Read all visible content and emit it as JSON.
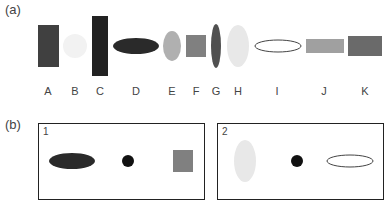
{
  "panels": {
    "a": {
      "label": "(a)",
      "shapes": [
        {
          "id": "A",
          "label": "A",
          "type": "rect",
          "color": "#404040"
        },
        {
          "id": "B",
          "label": "B",
          "type": "circle",
          "color": "#f2f2f2"
        },
        {
          "id": "C",
          "label": "C",
          "type": "rect",
          "color": "#222222"
        },
        {
          "id": "D",
          "label": "D",
          "type": "ellipse-horizontal",
          "color": "#2a2a2a"
        },
        {
          "id": "E",
          "label": "E",
          "type": "ellipse-vertical",
          "color": "#b0b0b0"
        },
        {
          "id": "F",
          "label": "F",
          "type": "square",
          "color": "#808080"
        },
        {
          "id": "G",
          "label": "G",
          "type": "ellipse-vertical",
          "color": "#505050"
        },
        {
          "id": "H",
          "label": "H",
          "type": "ellipse-vertical",
          "color": "#e8e8e8"
        },
        {
          "id": "I",
          "label": "I",
          "type": "ellipse-outline",
          "color": "#ffffff"
        },
        {
          "id": "J",
          "label": "J",
          "type": "rect",
          "color": "#a0a0a0"
        },
        {
          "id": "K",
          "label": "K",
          "type": "rect",
          "color": "#6a6a6a"
        }
      ]
    },
    "b": {
      "label": "(b)",
      "boxes": [
        {
          "label": "1",
          "items": [
            "dark-ellipse",
            "black-dot",
            "gray-square"
          ]
        },
        {
          "label": "2",
          "items": [
            "light-vertical-ellipse",
            "black-dot",
            "outline-ellipse"
          ]
        }
      ]
    }
  }
}
